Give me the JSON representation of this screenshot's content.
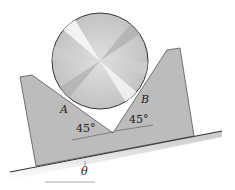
{
  "diagram": {
    "labels": {
      "contact_a": "A",
      "contact_b": "B",
      "angle_left": "45°",
      "angle_right": "45°",
      "incline_angle": "θ"
    },
    "colors": {
      "block_fill": "#b9b9b9",
      "block_edge": "#4a4a4a",
      "incline_shadow": "#cfcfcf",
      "cylinder_light": "#f4f4f4",
      "cylinder_dark": "#a8a8a8"
    }
  }
}
